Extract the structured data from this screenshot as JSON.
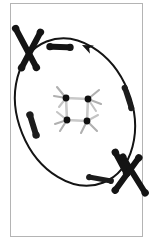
{
  "figure": {
    "title": "Molecular rotor orbiting a central cluster",
    "background_color": "#ffffff",
    "frame_color": "#b4b4b4",
    "ink_color": "#1a1a1a",
    "panel": {
      "x": 10,
      "y": 3,
      "width": 133,
      "height": 234
    }
  },
  "orbit": {
    "name": "elliptical-orbit-path",
    "center_x": 75,
    "center_y": 112,
    "radius_x": 57,
    "radius_y": 76,
    "rotation_deg": -22,
    "stroke_width": 2.0,
    "color": "#141414",
    "direction": "counterclockwise",
    "arrowhead": {
      "label": "direction-arrowhead",
      "x": 82,
      "y": 45,
      "angle_deg": 205,
      "size": 11
    }
  },
  "cluster": {
    "name": "central-square-cluster",
    "center_x": 77,
    "center_y": 109,
    "square_half": 11,
    "square_rotation_deg": 8,
    "edge_color": "#c9c9c9",
    "edge_width": 2.6,
    "atoms": [
      {
        "id": "atom-top-left",
        "dx": -11,
        "dy": -11,
        "r": 3.4,
        "fill": "#101010"
      },
      {
        "id": "atom-top-right",
        "dx": 11,
        "dy": -10,
        "r": 3.4,
        "fill": "#101010"
      },
      {
        "id": "atom-bottom-left",
        "dx": -10,
        "dy": 11,
        "r": 3.4,
        "fill": "#101010"
      },
      {
        "id": "atom-bottom-right",
        "dx": 10,
        "dy": 12,
        "r": 3.4,
        "fill": "#101010"
      }
    ],
    "ligands": [
      {
        "id": "ligand-1",
        "x1": -11,
        "y1": -11,
        "x2": -20,
        "y2": -22,
        "color": "#b0b0b0"
      },
      {
        "id": "ligand-2",
        "x1": -11,
        "y1": -11,
        "x2": -23,
        "y2": -13,
        "color": "#b0b0b0"
      },
      {
        "id": "ligand-3",
        "x1": -11,
        "y1": -11,
        "x2": -18,
        "y2": -2,
        "color": "#c4c4c4"
      },
      {
        "id": "ligand-4",
        "x1": 11,
        "y1": -10,
        "x2": 22,
        "y2": -19,
        "color": "#b0b0b0"
      },
      {
        "id": "ligand-5",
        "x1": 11,
        "y1": -10,
        "x2": 24,
        "y2": -5,
        "color": "#b0b0b0"
      },
      {
        "id": "ligand-6",
        "x1": 11,
        "y1": -10,
        "x2": 19,
        "y2": 2,
        "color": "#c4c4c4"
      },
      {
        "id": "ligand-7",
        "x1": -10,
        "y1": 11,
        "x2": -22,
        "y2": 15,
        "color": "#b0b0b0"
      },
      {
        "id": "ligand-8",
        "x1": -10,
        "y1": 11,
        "x2": -17,
        "y2": 22,
        "color": "#b0b0b0"
      },
      {
        "id": "ligand-9",
        "x1": -10,
        "y1": 11,
        "x2": -20,
        "y2": 3,
        "color": "#c4c4c4"
      },
      {
        "id": "ligand-10",
        "x1": 10,
        "y1": 12,
        "x2": 20,
        "y2": 22,
        "color": "#b0b0b0"
      },
      {
        "id": "ligand-11",
        "x1": 10,
        "y1": 12,
        "x2": 4,
        "y2": 24,
        "color": "#b0b0b0"
      },
      {
        "id": "ligand-12",
        "x1": 10,
        "y1": 12,
        "x2": 21,
        "y2": 6,
        "color": "#c4c4c4"
      }
    ]
  },
  "rods": [
    {
      "id": "rod-upper-left-a",
      "name": "rod-upper-left-a",
      "cx": 26,
      "cy": 48,
      "length": 44,
      "thickness": 6,
      "angle_deg": 62,
      "fill": "#141414"
    },
    {
      "id": "rod-upper-left-b",
      "name": "rod-upper-left-b",
      "cx": 31,
      "cy": 50,
      "length": 40,
      "thickness": 6,
      "angle_deg": 118,
      "fill": "#141414"
    },
    {
      "id": "rod-top-free",
      "name": "rod-top-free-floating",
      "cx": 60,
      "cy": 47,
      "length": 20,
      "thickness": 6,
      "angle_deg": 2,
      "fill": "#141414"
    },
    {
      "id": "rod-right-on-orbit",
      "name": "rod-right-on-orbit",
      "cx": 128,
      "cy": 98,
      "length": 21,
      "thickness": 5,
      "angle_deg": 72,
      "fill": "#1c1c1c"
    },
    {
      "id": "rod-left-on-orbit",
      "name": "rod-left-on-orbit",
      "cx": 33,
      "cy": 125,
      "length": 21,
      "thickness": 6,
      "angle_deg": 73,
      "fill": "#1c1c1c"
    },
    {
      "id": "rod-bottom-on-orbit",
      "name": "rod-bottom-on-orbit",
      "cx": 100,
      "cy": 179,
      "length": 22,
      "thickness": 5,
      "angle_deg": 10,
      "fill": "#1c1c1c"
    },
    {
      "id": "rod-lower-right-a",
      "name": "rod-lower-right-a",
      "cx": 121,
      "cy": 163,
      "length": 24,
      "thickness": 6,
      "angle_deg": 62,
      "fill": "#141414"
    },
    {
      "id": "rod-lower-right-b",
      "name": "rod-lower-right-b",
      "cx": 134,
      "cy": 175,
      "length": 42,
      "thickness": 6,
      "angle_deg": 58,
      "fill": "#141414"
    },
    {
      "id": "rod-lower-right-c",
      "name": "rod-lower-right-c",
      "cx": 127,
      "cy": 174,
      "length": 40,
      "thickness": 6,
      "angle_deg": 126,
      "fill": "#141414"
    }
  ],
  "chart_data": {
    "type": "diagram",
    "title": "Molecular rotor orbiting a central cluster",
    "elements": [
      {
        "label": "central cluster",
        "count": 1
      },
      {
        "label": "cluster atoms",
        "count": 4
      },
      {
        "label": "cluster ligands",
        "count": 12
      },
      {
        "label": "rod molecules",
        "count": 9
      },
      {
        "label": "orbit ellipse",
        "count": 1
      },
      {
        "label": "direction arrowhead",
        "count": 1
      }
    ]
  }
}
